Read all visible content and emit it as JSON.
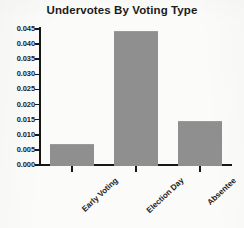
{
  "chart_data": {
    "type": "bar",
    "title": "Undervotes By Voting Type",
    "xlabel": "",
    "ylabel": "",
    "categories": [
      "Early Voting",
      "Election Day",
      "Absentee"
    ],
    "values": [
      0.0068,
      0.0443,
      0.0147
    ],
    "ylim": [
      0.0,
      0.045
    ],
    "ytick_labels": [
      "0.000",
      "0.005",
      "0.010",
      "0.015",
      "0.020",
      "0.025",
      "0.030",
      "0.035",
      "0.040",
      "0.045"
    ],
    "ytick_values": [
      0.0,
      0.005,
      0.01,
      0.015,
      0.02,
      0.025,
      0.03,
      0.035,
      0.04,
      0.045
    ],
    "grid": false,
    "legend": false,
    "bar_color": "#8f8f8f",
    "axis_color": "#171717",
    "background_color": "#fbfbfa"
  }
}
